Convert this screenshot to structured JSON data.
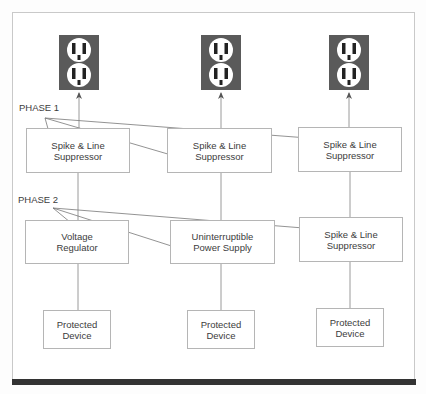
{
  "diagram": {
    "phases": [
      {
        "label": "PHASE 1"
      },
      {
        "label": "PHASE 2"
      }
    ],
    "columns": [
      {
        "outlet": {
          "icon": "electrical-outlet-icon"
        },
        "phase1_box": {
          "line1": "Spike & Line",
          "line2": "Suppressor"
        },
        "phase2_box": {
          "line1": "Voltage",
          "line2": "Regulator"
        },
        "device_box": {
          "line1": "Protected",
          "line2": "Device"
        }
      },
      {
        "outlet": {
          "icon": "electrical-outlet-icon"
        },
        "phase1_box": {
          "line1": "Spike & Line",
          "line2": "Suppressor"
        },
        "phase2_box": {
          "line1": "Uninterruptible",
          "line2": "Power Supply"
        },
        "device_box": {
          "line1": "Protected",
          "line2": "Device"
        }
      },
      {
        "outlet": {
          "icon": "electrical-outlet-icon"
        },
        "phase1_box": {
          "line1": "Spike & Line",
          "line2": "Suppressor"
        },
        "phase2_box": {
          "line1": "Spike & Line",
          "line2": "Suppressor"
        },
        "device_box": {
          "line1": "Protected",
          "line2": "Device"
        }
      }
    ],
    "colors": {
      "outlet_plate": "#5a5a5a",
      "outlet_face": "#ffffff",
      "line": "#9a9a9a",
      "arrow": "#555555",
      "bottom_bar": "#333333"
    }
  }
}
